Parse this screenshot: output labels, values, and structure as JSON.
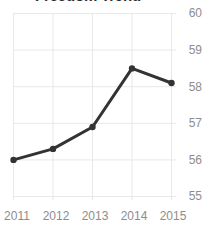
{
  "chart_data": {
    "type": "line",
    "title": "Freedom Trend",
    "xlabel": "",
    "ylabel": "",
    "categories": [
      "2011",
      "2012",
      "2013",
      "2014",
      "2015"
    ],
    "x": [
      2011,
      2012,
      2013,
      2014,
      2015
    ],
    "values": [
      56.0,
      56.3,
      56.9,
      58.5,
      58.1
    ],
    "series": [
      {
        "name": "Freedom Score",
        "values": [
          56.0,
          56.3,
          56.9,
          58.5,
          58.1
        ]
      }
    ],
    "ylim": [
      55,
      60
    ],
    "xlim": [
      2011,
      2015
    ],
    "y_ticks": [
      "60",
      "59",
      "58",
      "57",
      "56",
      "55"
    ],
    "y_tick_values": [
      60,
      59,
      58,
      57,
      56,
      55
    ],
    "x_ticks": [
      "2011",
      "2012",
      "2013",
      "2014",
      "2015"
    ],
    "grid": true,
    "grid_x": true,
    "grid_y": true,
    "legend": false,
    "legend_position": "none",
    "markers": true,
    "y_axis_side": "right",
    "colors": {
      "line": "#333333",
      "marker": "#333333",
      "grid": "#e6e6e6",
      "tick_label": "#8d8d8d",
      "title": "#2b2b2b",
      "background": "#ffffff"
    }
  }
}
